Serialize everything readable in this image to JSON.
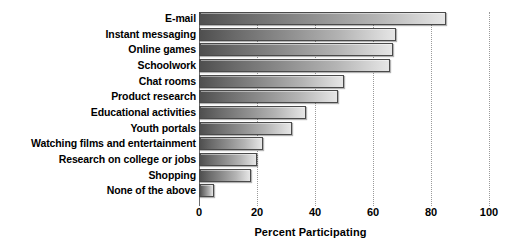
{
  "chart_data": {
    "type": "bar",
    "orientation": "horizontal",
    "title": "",
    "xlabel": "Percent Participating",
    "ylabel": "",
    "xlim": [
      0,
      100
    ],
    "xticks": [
      0,
      20,
      40,
      60,
      80,
      100
    ],
    "xticklabels": [
      "0",
      "20",
      "40",
      "60",
      "80",
      "100"
    ],
    "grid": true,
    "legend": false,
    "categories": [
      "E-mail",
      "Instant messaging",
      "Online games",
      "Schoolwork",
      "Chat rooms",
      "Product research",
      "Educational activities",
      "Youth portals",
      "Watching films and entertainment",
      "Research on college or jobs",
      "Shopping",
      "None of the above"
    ],
    "values": [
      85,
      68,
      67,
      66,
      50,
      48,
      37,
      32,
      22,
      20,
      18,
      5
    ],
    "bar_color_start": "#4f4f4f",
    "bar_color_end": "#e6e6e6",
    "bar_border_color": "#4a4a4a",
    "gridline_color": "#9a9a9a",
    "axis_color": "#6d6d6d"
  }
}
